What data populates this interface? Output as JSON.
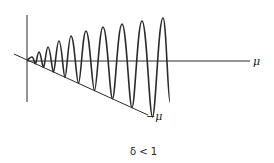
{
  "diagram": {
    "axis_label_x": "μ",
    "line_label": "−μ",
    "caption": "δ < 1",
    "line_color": "#2a2a2a",
    "peaks": [
      [
        32,
        57
      ],
      [
        39,
        52
      ],
      [
        48,
        47
      ],
      [
        59,
        41
      ],
      [
        71,
        36
      ],
      [
        86,
        31
      ],
      [
        103,
        27
      ],
      [
        122,
        24
      ],
      [
        142,
        21
      ],
      [
        163,
        18
      ]
    ]
  }
}
